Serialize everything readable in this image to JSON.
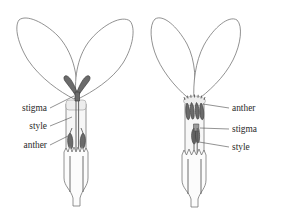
{
  "figure": {
    "background_color": "#ffffff",
    "outline_color": "#6e6e6e",
    "organ_color": "#6b6b6b",
    "label_color": "#2b2b2b"
  },
  "flowers": [
    {
      "id": "left-flower",
      "name": "long-styled-morph",
      "description": "Flower with exserted bifid stigma above the corolla throat and anthers enclosed low within the tube",
      "labels": [
        {
          "text": "stigma",
          "side": "left",
          "x": 47,
          "y": 111,
          "target_x": 74,
          "target_y": 96
        },
        {
          "text": "style",
          "side": "left",
          "x": 47,
          "y": 129,
          "target_x": 72,
          "target_y": 117
        },
        {
          "text": "anther",
          "side": "left",
          "x": 47,
          "y": 148,
          "target_x": 68,
          "target_y": 136
        }
      ]
    },
    {
      "id": "right-flower",
      "name": "short-styled-morph",
      "description": "Flower with anthers exserted at the corolla throat and the stigma held lower inside the tube",
      "labels": [
        {
          "text": "anther",
          "side": "right",
          "x": 232,
          "y": 111,
          "target_x": 203,
          "target_y": 104
        },
        {
          "text": "stigma",
          "side": "right",
          "x": 232,
          "y": 132,
          "target_x": 200,
          "target_y": 128
        },
        {
          "text": "style",
          "side": "right",
          "x": 232,
          "y": 150,
          "target_x": 199,
          "target_y": 142
        }
      ]
    }
  ]
}
